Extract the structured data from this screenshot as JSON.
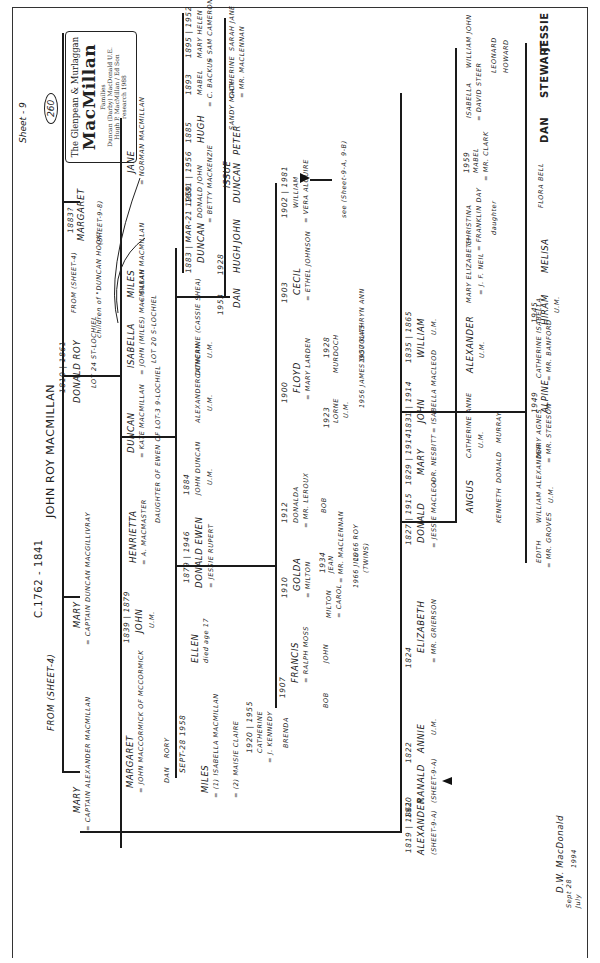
{
  "document": {
    "type": "handwritten genealogy chart (scanned, rotated 90°)",
    "sheet_label": "Sheet - 9",
    "sheet_number_circled": "260",
    "title_box": {
      "line1": "The Glenpean & Murlaggan",
      "line2": "MacMillan",
      "line3": "Families",
      "line4": "by",
      "line5": "Duncan (Darby) MacDonald U.E.",
      "line6": "based on the",
      "line7": "early research",
      "line8": "of",
      "line9": "Hugh P. MacMillan / Ed Son",
      "line10": "and Ken MacMillan",
      "line11": "research 1988"
    },
    "signature": "D.W. MacDonald",
    "signature_date_line1": "Sept 28",
    "signature_date_line2": "July",
    "signature_year": "1994"
  },
  "root": {
    "dates": "c.1762 - 1841",
    "name": "JOHN ROY MacMILLAN",
    "from_note": "from (Sheet-4)"
  },
  "generation1": [
    {
      "name": "MARY",
      "spouse": "= CAPTAIN ALEXANDER MacMILLAN"
    },
    {
      "name": "MARY",
      "spouse": "= CAPTAIN DUNCAN MacGILLIVRAY"
    },
    {
      "dates": "1810 | 1861",
      "name": "DONALD ROY",
      "spouse": "=",
      "note": "LOT 24 ST-LOCHIEL",
      "from_note": "from (Sheet-4)"
    },
    {
      "dates": "1883?",
      "name": "MARGARET",
      "note": "(Sheet-9-8)"
    }
  ],
  "donald_roy_children": [
    {
      "name": "MARGARET",
      "spouse": "= JOHN MacCORMICK of McCORMICK",
      "children": [
        "DAN",
        "RORY"
      ]
    },
    {
      "dates": "1839 | 1879",
      "name": "JOHN",
      "note": "U.M."
    },
    {
      "name": "HENRIETTA",
      "spouse": "= A. MacMASTER"
    },
    {
      "name": "DUNCAN",
      "spouse": "= KATE MacMILLAN",
      "note": "daughter of EWEN of LOT-3 9-LOCHIEL"
    },
    {
      "name": "ISABELLA",
      "spouse": "= JOHN (MILES) MacMILLAN",
      "note": "LOT 20 S-LOCHIEL"
    },
    {
      "name": "MILES",
      "spouse": "= SARAH MacMILLAN"
    },
    {
      "name": "JANE",
      "spouse": "= NORMAN MacMILLAN"
    },
    {
      "annotation": "children of \"DUNCAN HOOK\""
    }
  ],
  "duncan_kate_children": [
    {
      "name": "MILES",
      "dates": "SEPT-28 1958",
      "spouse": "= (1) ISABELLA MacMILLAN",
      "spouse2": "= (2) MAISIE CLAIRE",
      "children": [
        {
          "dates": "1920 | 1955",
          "name": "CATHERINE",
          "spouse": "= J. KENNEDY",
          "children": [
            "BRENDA"
          ]
        }
      ]
    },
    {
      "name": "ELLEN",
      "note": "died age 17"
    },
    {
      "dates": "1879 | 1946",
      "name": "DONALD EWEN",
      "spouse": "= JESSIE RUPERT"
    },
    {
      "dates": "1884",
      "name": "JOHN DUNCAN",
      "note": "U.M."
    },
    {
      "name": "ALEXANDER DUNCAN",
      "note": "U.M."
    },
    {
      "name": "CATHERINE (CASSIE SHEA)",
      "note": "U.M."
    },
    {
      "dates": "1953",
      "name": "DAN"
    },
    {
      "dates": "1928",
      "name": "HUGH"
    },
    {
      "name": "JOHN"
    },
    {
      "name": "DUNCAN"
    },
    {
      "name": "PETER"
    },
    {
      "name": "SANDY MACK"
    },
    {
      "name": "CATHERINE",
      "spouse": "= MR. MacLENNAN"
    },
    {
      "name": "SARAH JANE"
    }
  ],
  "miles_sarah_children": [
    {
      "dates": "1883 | MAR-21 1959",
      "name": "DUNCAN"
    },
    {
      "dates": "1881 | 1956",
      "name": "DONALD JOHN",
      "spouse": "= BETTY MacKENZIE",
      "issue": "ISSUE"
    },
    {
      "dates": "1885",
      "name": "HUGH"
    },
    {
      "dates": "1893",
      "name": "MABEL",
      "spouse": "= C. BACKUS"
    },
    {
      "dates": "1895 | 1952",
      "name": "MARY HELEN",
      "spouse": "= SAM CAMERON"
    }
  ],
  "donald_ewen_children": [
    {
      "dates": "1907",
      "name": "FRANCIS",
      "spouse": "= RALPH MOSS",
      "children": [
        "BOB",
        "JOHN"
      ]
    },
    {
      "dates": "1910",
      "name": "GOLDA",
      "spouse": "= MILTON",
      "children": [
        {
          "name": "MILTON",
          "spouse": "= CAROL"
        },
        {
          "dates": "1934",
          "name": "JEAN",
          "spouse": "= MR. MacLENNAN",
          "children": [
            "1966 JILL",
            "1966 ROY",
            "(TWINS)"
          ]
        }
      ]
    },
    {
      "dates": "1912",
      "name": "DONALDA",
      "spouse": "= MR. LEROUX",
      "children": [
        "BOB"
      ]
    },
    {
      "dates": "1900",
      "name": "FLOYD",
      "spouse": "= MARY LARDEN",
      "children": [
        {
          "dates": "1923",
          "name": "LORNE",
          "note": "U.M."
        },
        {
          "dates": "1928",
          "name": "MURDOCH",
          "spouse": "=",
          "children": [
            "1956 JAMES DOUGLAS",
            "1957 KATHRYN ANN"
          ]
        }
      ]
    },
    {
      "dates": "1903",
      "name": "CECIL",
      "spouse": "= ETHEL JOHNSON"
    },
    {
      "dates": "1902 | 1981",
      "name": "WILLIAM",
      "spouse": "= VERA ALGUIRE",
      "note": "see (Sheet-9-A, 9-B)"
    }
  ],
  "captain_alexander_children": [
    {
      "dates": "1819 | 1861",
      "name": "ALEXANDER",
      "note": "(Sheet-9-A)"
    },
    {
      "dates": "1820",
      "name": "RANALD",
      "note": "(Sheet-9-A)"
    },
    {
      "dates": "1822",
      "name": "ANNIE",
      "note": "U.M."
    },
    {
      "dates": "1824",
      "name": "ELIZABETH",
      "spouse": "= MR. GRIERSON"
    },
    {
      "dates": "1827 | 1915",
      "name": "DONALD",
      "spouse": "= JESSIE MacLEOD"
    },
    {
      "dates": "1829 | 1914",
      "name": "MARY",
      "spouse": "= R. NESBITT"
    },
    {
      "dates": "1831 | 1914",
      "name": "JOHN",
      "spouse": "= ISABELLA MacLEOD"
    },
    {
      "dates": "1835 | 1865",
      "name": "WILLIAM",
      "note": "U.M."
    }
  ],
  "donald_jessie_children": [
    {
      "name": "ANGUS",
      "children": [
        "KENNETH",
        "DONALD",
        "MURRAY"
      ]
    },
    {
      "name": "CATHERINE ANNE",
      "note": "U.M."
    },
    {
      "name": "ALEXANDER",
      "note": "U.M."
    },
    {
      "name": "MARY ELIZABETH",
      "spouse": "= J. F. NEIL"
    },
    {
      "name": "CHRISTINA",
      "spouse": "= FRANKLIN DAY",
      "note": "daughter"
    },
    {
      "dates": "1959",
      "name": "MABEL",
      "spouse": "= MR. CLARK"
    },
    {
      "name": "ISABELLA",
      "spouse": "= DAVID STEER"
    },
    {
      "name": "WILLIAM JOHN",
      "children": [
        "LEONARD",
        "HOWARD"
      ]
    }
  ],
  "john_isabella_children": [
    {
      "name": "EDITH",
      "spouse": "= MR. GROVES"
    },
    {
      "name": "WILLIAM ALEXANDER",
      "note": "U.M."
    },
    {
      "name": "MARY AGNES",
      "spouse": "= MR. STEESON"
    },
    {
      "dates": "1949",
      "name": "ALPINE"
    },
    {
      "name": "CATHERINE ISABELLA",
      "spouse": "= MR. BANFORD"
    },
    {
      "dates": "1945",
      "name": "HIRAM",
      "note": "U.M."
    },
    {
      "name": "MELISA"
    },
    {
      "name": "FLORA BELL"
    },
    {
      "name": "DAN"
    },
    {
      "name": "STEWART"
    },
    {
      "name": "JESSIE"
    }
  ]
}
